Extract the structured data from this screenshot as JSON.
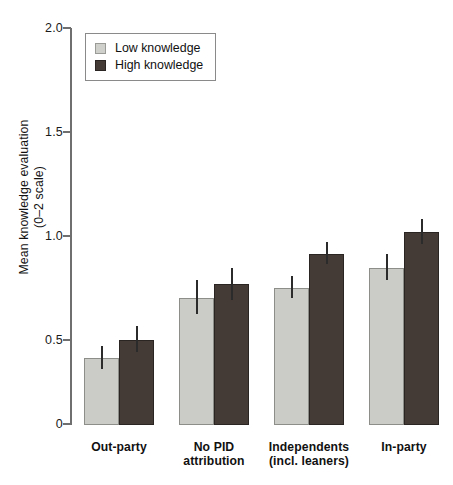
{
  "chart_data": {
    "type": "bar",
    "title": "",
    "subtitle": "",
    "xlabel": "",
    "ylabel": "Mean knowledge evaluation (0–2 scale)",
    "ylabel_line1": "Mean knowledge evaluation",
    "ylabel_line2": "(0–2 scale)",
    "ylim": [
      0,
      2.0
    ],
    "yticks": [
      0,
      0.5,
      1.0,
      1.5,
      2.0
    ],
    "ytick_labels": [
      "0",
      "0.5",
      "1.0",
      "1.5",
      "2.0"
    ],
    "grid": false,
    "legend_position": "top-left",
    "categories": [
      "Out-party",
      "No PID attribution",
      "Independents (incl. leaners)",
      "In-party"
    ],
    "category_lines": [
      [
        "Out-party"
      ],
      [
        "No PID",
        "attribution"
      ],
      [
        "Independents",
        "(incl. leaners)"
      ],
      [
        "In-party"
      ]
    ],
    "series": [
      {
        "name": "Low knowledge",
        "color": "#cbcbc7",
        "values": [
          0.34,
          0.64,
          0.69,
          0.79
        ],
        "err_low": [
          0.28,
          0.56,
          0.64,
          0.73
        ],
        "err_high": [
          0.4,
          0.73,
          0.75,
          0.86
        ]
      },
      {
        "name": "High knowledge",
        "color": "#443b37",
        "values": [
          0.43,
          0.71,
          0.86,
          0.97
        ],
        "err_low": [
          0.37,
          0.63,
          0.81,
          0.91
        ],
        "err_high": [
          0.5,
          0.79,
          0.92,
          1.04
        ]
      }
    ]
  },
  "legend": {
    "items": [
      {
        "label": "Low knowledge",
        "swatch": "light-square-icon"
      },
      {
        "label": "High knowledge",
        "swatch": "dark-square-icon"
      }
    ]
  },
  "axes": {
    "y_title_line1": "Mean knowledge evaluation",
    "y_title_line2": "(0–2 scale)",
    "y_tick_0": "0",
    "y_tick_1": "0.5",
    "y_tick_2": "1.0",
    "y_tick_3": "1.5",
    "y_tick_4": "2.0"
  },
  "x_axis": {
    "g0_l0": "Out-party",
    "g1_l0": "No PID",
    "g1_l1": "attribution",
    "g2_l0": "Independents",
    "g2_l1": "(incl. leaners)",
    "g3_l0": "In-party"
  }
}
